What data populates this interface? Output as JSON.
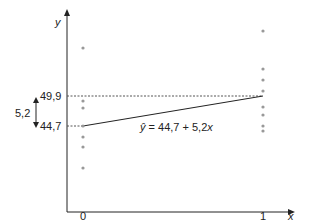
{
  "chart_data": {
    "type": "scatter",
    "title": "",
    "xlabel": "x",
    "ylabel": "y",
    "x_ticks": [
      "0",
      "1"
    ],
    "series": [
      {
        "name": "observations x=0",
        "x": 0,
        "y_pixel_positions": [
          48,
          101,
          108,
          126,
          137,
          147,
          168
        ],
        "note": "scatter points at x=0, values unlabeled"
      },
      {
        "name": "observations x=1",
        "x": 1,
        "y_pixel_positions": [
          31,
          69,
          80,
          91,
          107,
          115,
          126,
          131
        ],
        "note": "scatter points at x=1, values unlabeled"
      }
    ],
    "regression_line": {
      "equation": "ŷ = 44,7 + 5,2x",
      "intercept": 44.7,
      "slope": 5.2,
      "from": {
        "x": 0,
        "y": 44.7
      },
      "to": {
        "x": 1,
        "y": 49.9
      }
    },
    "annotations": {
      "y_level_high": "49,9",
      "y_level_low": "44,7",
      "difference": "5,2"
    },
    "grid": false,
    "legend": "none"
  },
  "labels": {
    "y_axis": "y",
    "x_axis": "x",
    "tick_0": "0",
    "tick_1": "1",
    "level_high": "49,9",
    "level_low": "44,7",
    "difference": "5,2",
    "equation_hat": "ŷ",
    "equation_rest": " = 44,7 + 5,2",
    "equation_x": "x"
  },
  "colors": {
    "axis": "#222222",
    "points": "#999999",
    "line": "#222222",
    "dashed": "#555555"
  }
}
